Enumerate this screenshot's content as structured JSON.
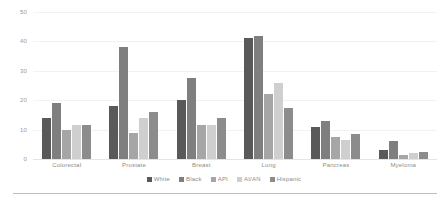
{
  "chart_data": {
    "type": "bar",
    "title": "",
    "subtitle": "",
    "xlabel": "",
    "ylabel": "",
    "categories": [
      "Colorectal",
      "Prostate",
      "Breast",
      "Lung",
      "Pancreas",
      "Myeloma"
    ],
    "series": [
      {
        "name": "White",
        "color": "#595959",
        "values": [
          14,
          18,
          20,
          41,
          11,
          3
        ]
      },
      {
        "name": "Black",
        "color": "#7f7f7f",
        "values": [
          19,
          38,
          27.5,
          42,
          13,
          6
        ]
      },
      {
        "name": "API",
        "color": "#a6a6a6",
        "values": [
          10,
          9,
          11.5,
          22,
          7.5,
          1.5
        ]
      },
      {
        "name": "AI/AN",
        "color": "#cfcfcf",
        "values": [
          11.5,
          14,
          11.5,
          26,
          6.5,
          2
        ]
      },
      {
        "name": "Hispanic",
        "color": "#8c8c8c",
        "values": [
          11.5,
          16,
          14,
          17.5,
          8.5,
          2.5
        ]
      }
    ],
    "ylim": [
      0,
      50
    ],
    "yticks": [
      0,
      10,
      20,
      30,
      40,
      50
    ],
    "ytick_labels": [
      "0",
      "10",
      "20",
      "30",
      "40",
      "50"
    ],
    "grid": true,
    "legend_position": "bottom",
    "axis_color": "#9a9a9a",
    "gridline_color": "#f2f2f2",
    "background": "#ffffff"
  }
}
